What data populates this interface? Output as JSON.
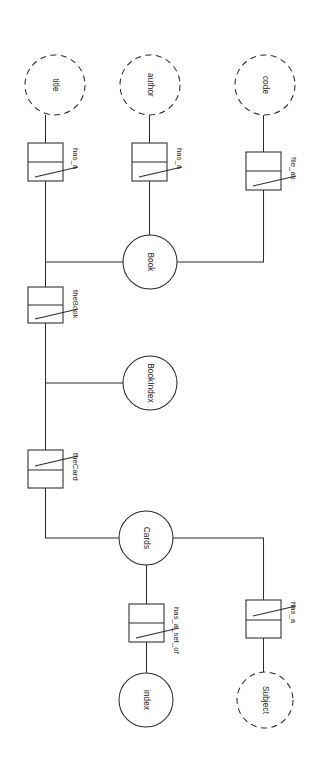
{
  "diagram": {
    "orientation": "rotated-90",
    "stroke_color": "#2b2b2b",
    "background_color": "#ffffff",
    "entities": [
      {
        "id": "title",
        "label": "title",
        "shape": "dashed-circle",
        "cx": 55,
        "cy": 85,
        "r": 30
      },
      {
        "id": "author",
        "label": "author",
        "shape": "dashed-circle",
        "cx": 150,
        "cy": 85,
        "r": 30
      },
      {
        "id": "code",
        "label": "code",
        "shape": "dashed-circle",
        "cx": 265,
        "cy": 85,
        "r": 30
      },
      {
        "id": "book",
        "label": "Book",
        "shape": "solid-circle",
        "cx": 150,
        "cy": 262,
        "r": 27
      },
      {
        "id": "bookindex",
        "label": "BookIndex",
        "shape": "solid-circle",
        "cx": 150,
        "cy": 383,
        "r": 27
      },
      {
        "id": "cards",
        "label": "Cards",
        "shape": "solid-circle",
        "cx": 146,
        "cy": 538,
        "r": 27
      },
      {
        "id": "index",
        "label": "index",
        "shape": "solid-circle",
        "cx": 146,
        "cy": 700,
        "r": 27
      },
      {
        "id": "subject",
        "label": "Subject",
        "shape": "dashed-circle",
        "cx": 265,
        "cy": 700,
        "r": 28
      }
    ],
    "relationships": [
      {
        "id": "has_a_title",
        "label": "has_a",
        "x": 28,
        "y": 143,
        "w": 35,
        "h": 38,
        "slash": "lower",
        "label_x": 70,
        "label_y": 148
      },
      {
        "id": "has_a_author",
        "label": "has_a",
        "x": 132,
        "y": 143,
        "w": 35,
        "h": 38,
        "slash": "lower",
        "label_x": 174,
        "label_y": 148
      },
      {
        "id": "file_as",
        "label": "file_as",
        "x": 246,
        "y": 152,
        "w": 35,
        "h": 38,
        "slash": "lower",
        "label_x": 288,
        "label_y": 157
      },
      {
        "id": "thebook",
        "label": "theBook",
        "x": 28,
        "y": 287,
        "w": 35,
        "h": 36,
        "slash": "lower",
        "label_x": 70,
        "label_y": 292
      },
      {
        "id": "thecard",
        "label": "theCard",
        "x": 28,
        "y": 450,
        "w": 35,
        "h": 38,
        "slash": "upper",
        "label_x": 70,
        "label_y": 455
      },
      {
        "id": "has_a_set_of",
        "label": "has_a_set_of",
        "x": 129,
        "y": 604,
        "w": 35,
        "h": 38,
        "slash": "lower",
        "label_x": 170,
        "label_y": 609
      },
      {
        "id": "has_a_subject",
        "label": "has_a",
        "x": 246,
        "y": 600,
        "w": 35,
        "h": 38,
        "slash": "upper",
        "label_x": 288,
        "label_y": 605
      }
    ],
    "edges": [
      {
        "id": "title-to-has_a",
        "from": "title",
        "to": "has_a_title"
      },
      {
        "id": "has_a-to-spine",
        "from": "has_a_title",
        "to": "spine"
      },
      {
        "id": "author-to-has_a",
        "from": "author",
        "to": "has_a_author"
      },
      {
        "id": "has_a-to-book",
        "from": "has_a_author",
        "to": "book"
      },
      {
        "id": "code-to-file_as",
        "from": "code",
        "to": "file_as"
      },
      {
        "id": "file_as-to-book",
        "from": "file_as",
        "to": "book"
      },
      {
        "id": "book-to-spine",
        "from": "book",
        "to": "spine"
      },
      {
        "id": "spine-to-thebook",
        "from": "spine",
        "to": "thebook"
      },
      {
        "id": "spine-to-bookindex",
        "from": "spine",
        "to": "bookindex"
      },
      {
        "id": "spine-to-thecard",
        "from": "spine",
        "to": "thecard"
      },
      {
        "id": "thecard-to-cards",
        "from": "thecard",
        "to": "cards"
      },
      {
        "id": "cards-to-has_a_set_of",
        "from": "cards",
        "to": "has_a_set_of"
      },
      {
        "id": "has_a_set_of-to-index",
        "from": "has_a_set_of",
        "to": "index"
      },
      {
        "id": "cards-to-has_a",
        "from": "cards",
        "to": "has_a_subject"
      },
      {
        "id": "has_a-to-subject",
        "from": "has_a_subject",
        "to": "subject"
      }
    ]
  }
}
